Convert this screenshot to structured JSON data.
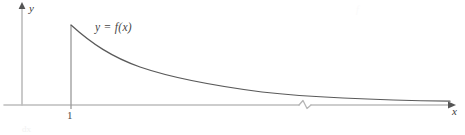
{
  "figure": {
    "kind": "improper-integral-decay-curve",
    "background_color": "#ffffff",
    "axis_color": "#bdbdbd",
    "curve_color": "#5a5a5a",
    "text_color": "#3a3a3a",
    "width": 465,
    "height": 135
  },
  "axes": {
    "y_axis": {
      "label": "y",
      "x_position": 22,
      "top": 6,
      "bottom": 105,
      "arrow": "arrow-up"
    },
    "x_axis": {
      "label": "x",
      "y_position": 105,
      "left": 4,
      "right": 452,
      "arrow": "arrow-right",
      "has_break": true,
      "break_x": 305,
      "break_symbol": "zigzag"
    }
  },
  "ticks": [
    {
      "label": "1",
      "x_position": 71,
      "axis": "x"
    }
  ],
  "curve": {
    "label": "y = f(x)",
    "start_x": 71,
    "start_y": 25,
    "end_x": 450,
    "end_y": 101,
    "shape": "monotonic-decreasing-convex",
    "asymptote": "x-axis"
  },
  "vertical_line": {
    "x_position": 71,
    "top": 25,
    "bottom": 109
  },
  "artifacts": {
    "top_right_smudge": "f",
    "bottom_left_smudge": "dx"
  }
}
